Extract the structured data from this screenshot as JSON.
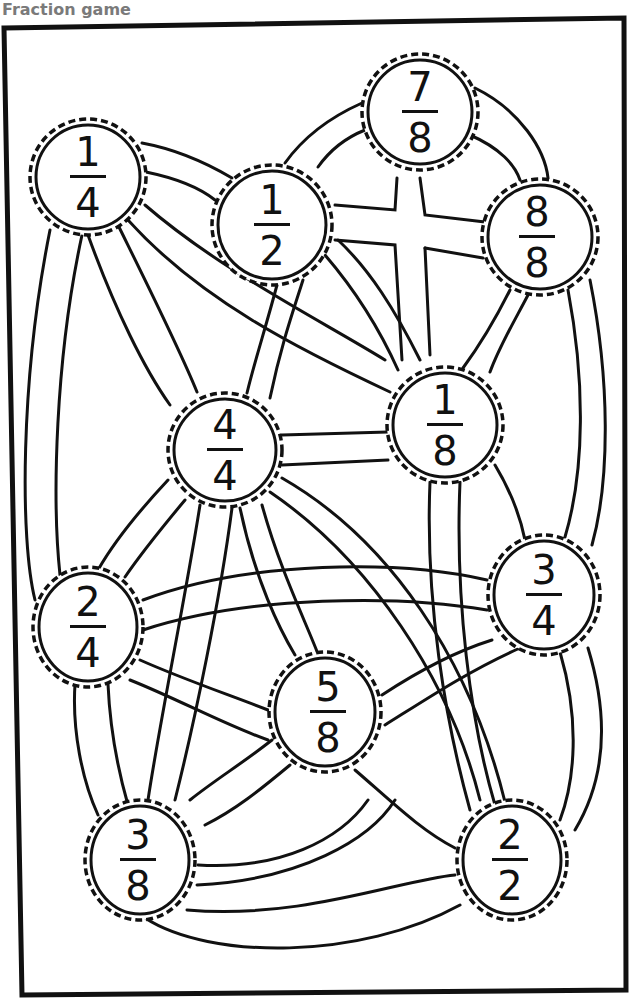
{
  "header": {
    "title": "Fraction game"
  },
  "colors": {
    "ink": "#111111",
    "title": "#7a7a7a",
    "paper": "#ffffff"
  },
  "nodes": [
    {
      "id": "n14",
      "numerator": "1",
      "denominator": "4",
      "cx": 88,
      "cy": 177,
      "r": 58
    },
    {
      "id": "n12",
      "numerator": "1",
      "denominator": "2",
      "cx": 272,
      "cy": 225,
      "r": 60
    },
    {
      "id": "n78",
      "numerator": "7",
      "denominator": "8",
      "cx": 420,
      "cy": 112,
      "r": 58
    },
    {
      "id": "n88",
      "numerator": "8",
      "denominator": "8",
      "cx": 540,
      "cy": 237,
      "r": 58
    },
    {
      "id": "n44",
      "numerator": "4",
      "denominator": "4",
      "cx": 225,
      "cy": 450,
      "r": 57
    },
    {
      "id": "n18",
      "numerator": "1",
      "denominator": "8",
      "cx": 445,
      "cy": 425,
      "r": 58
    },
    {
      "id": "n24",
      "numerator": "2",
      "denominator": "4",
      "cx": 88,
      "cy": 627,
      "r": 57
    },
    {
      "id": "n34",
      "numerator": "3",
      "denominator": "4",
      "cx": 544,
      "cy": 595,
      "r": 58
    },
    {
      "id": "n58",
      "numerator": "5",
      "denominator": "8",
      "cx": 325,
      "cy": 712,
      "r": 58
    },
    {
      "id": "n38",
      "numerator": "3",
      "denominator": "8",
      "cx": 140,
      "cy": 860,
      "r": 57
    },
    {
      "id": "n22",
      "numerator": "2",
      "denominator": "2",
      "cx": 512,
      "cy": 860,
      "r": 57
    }
  ]
}
